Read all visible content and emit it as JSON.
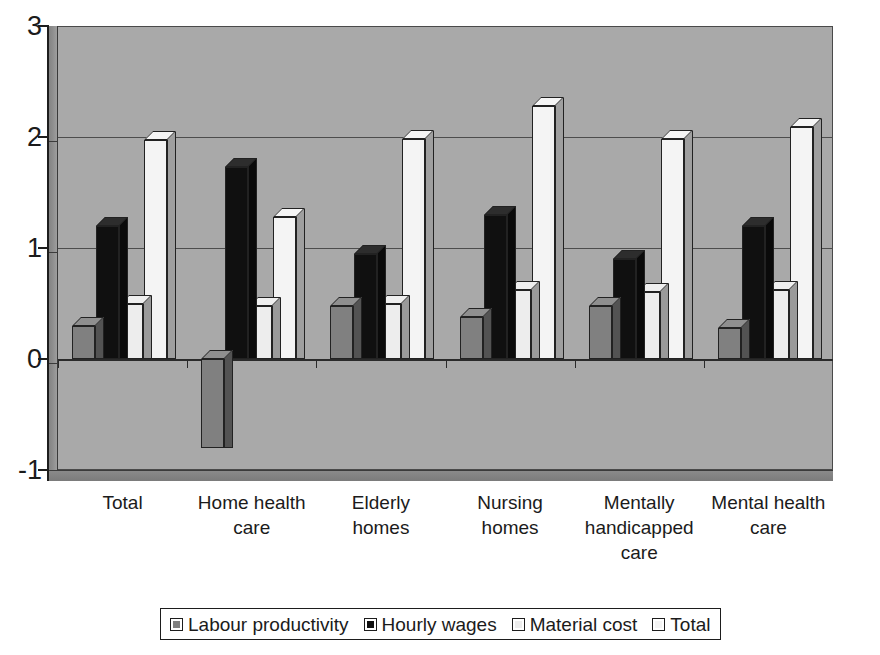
{
  "chart_data": {
    "type": "bar",
    "title": "",
    "subtitle": "",
    "xlabel": "",
    "ylabel": "",
    "ylim": [
      -1,
      3
    ],
    "yticks": [
      3,
      2,
      1,
      0,
      -1
    ],
    "ytick_labels": [
      "3",
      "2",
      "1",
      "0",
      "-1"
    ],
    "grid": true,
    "legend_position": "bottom",
    "style": "3d-clustered-column",
    "categories": [
      "Total",
      "Home health\ncare",
      "Elderly\nhomes",
      "Nursing\nhomes",
      "Mentally\nhandicapped\ncare",
      "Mental health\ncare"
    ],
    "series": [
      {
        "name": "Labour productivity",
        "color": "#808080",
        "values": [
          0.3,
          -0.8,
          0.48,
          0.38,
          0.48,
          0.28
        ]
      },
      {
        "name": "Hourly wages",
        "color": "#101010",
        "values": [
          1.2,
          1.73,
          0.95,
          1.3,
          0.9,
          1.2
        ]
      },
      {
        "name": "Material cost",
        "color": "#ededed",
        "values": [
          0.5,
          0.48,
          0.5,
          0.62,
          0.6,
          0.62
        ]
      },
      {
        "name": "Total",
        "color": "#f4f4f4",
        "values": [
          1.97,
          1.28,
          1.98,
          2.28,
          1.98,
          2.09
        ]
      }
    ]
  },
  "legend": {
    "items": [
      {
        "label": "Labour productivity",
        "color": "#808080"
      },
      {
        "label": "Hourly wages",
        "color": "#101010"
      },
      {
        "label": "Material cost",
        "color": "#ededed"
      },
      {
        "label": "Total",
        "color": "#f4f4f4"
      }
    ]
  },
  "colors": {
    "plot_background": "#a9a9a9",
    "wall_left": "#8d8d8d",
    "floor": "#828282",
    "axis": "#1d1d1d",
    "gridline": "#4d4d4d",
    "text": "#1b1b1b",
    "page_background": "#ffffff"
  }
}
